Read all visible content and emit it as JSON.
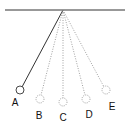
{
  "diagram": {
    "type": "pendulum-positions",
    "colors": {
      "line": "#333333",
      "dotted": "#888888",
      "background": "#ffffff"
    },
    "positions": [
      {
        "label": "A",
        "style": "solid"
      },
      {
        "label": "B",
        "style": "dotted"
      },
      {
        "label": "C",
        "style": "dotted"
      },
      {
        "label": "D",
        "style": "dotted"
      },
      {
        "label": "E",
        "style": "dotted"
      }
    ]
  }
}
